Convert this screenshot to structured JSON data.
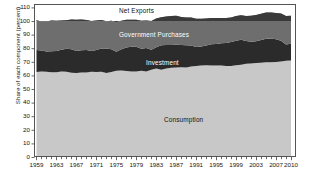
{
  "chart_data": {
    "type": "area",
    "stacked": true,
    "title": "",
    "xlabel": "",
    "ylabel": "Share of each component (percent)",
    "ylim": [
      0,
      112.5
    ],
    "yticks": [
      0,
      10,
      20,
      30,
      40,
      50,
      60,
      70,
      80,
      90,
      100,
      110
    ],
    "xlim": [
      1958.5,
      2011
    ],
    "xticks": [
      1959,
      1963,
      1967,
      1971,
      1975,
      1979,
      1983,
      1987,
      1991,
      1995,
      1999,
      2003,
      2007,
      2010
    ],
    "xtick_labels": [
      "1959",
      "1963",
      "1967",
      "1971",
      "1975",
      "1979",
      "1983",
      "1987",
      "1991",
      "1995",
      "1999",
      "2003",
      "2007",
      "2010"
    ],
    "minor_xtick_step": 1,
    "grid": false,
    "legend": "inline-annotations",
    "x": [
      1959,
      1960,
      1961,
      1962,
      1963,
      1964,
      1965,
      1966,
      1967,
      1968,
      1969,
      1970,
      1971,
      1972,
      1973,
      1974,
      1975,
      1976,
      1977,
      1978,
      1979,
      1980,
      1981,
      1982,
      1983,
      1984,
      1985,
      1986,
      1987,
      1988,
      1989,
      1990,
      1991,
      1992,
      1993,
      1994,
      1995,
      1996,
      1997,
      1998,
      1999,
      2000,
      2001,
      2002,
      2003,
      2004,
      2005,
      2006,
      2007,
      2008,
      2009,
      2010
    ],
    "series": [
      {
        "name": "Consumption",
        "color": "#c8c8c8",
        "label_color": "#111111",
        "label_x": 164,
        "label_y": 117,
        "values": [
          62.5,
          62.9,
          62.6,
          62.3,
          62.3,
          62.9,
          62.6,
          61.9,
          61.8,
          62.2,
          62.1,
          62.6,
          62.5,
          62.7,
          61.8,
          62.5,
          63.4,
          63.6,
          63.3,
          62.9,
          62.9,
          63.4,
          62.9,
          64.1,
          65.1,
          64.2,
          65.0,
          65.6,
          65.9,
          66.0,
          65.9,
          66.5,
          67.0,
          67.2,
          67.4,
          67.3,
          67.3,
          67.3,
          66.9,
          66.9,
          67.4,
          67.9,
          68.5,
          68.8,
          69.1,
          69.3,
          69.7,
          69.7,
          69.8,
          70.3,
          70.8,
          70.9
        ]
      },
      {
        "name": "Investment",
        "color": "#2b2b2b",
        "label_color": "#ffffff",
        "label_x": 146,
        "label_y": 60,
        "values": [
          16.2,
          15.5,
          14.9,
          15.5,
          15.7,
          16.0,
          17.0,
          17.3,
          16.2,
          16.3,
          16.6,
          15.4,
          16.2,
          17.0,
          17.9,
          16.8,
          14.0,
          15.6,
          17.3,
          18.2,
          18.2,
          16.2,
          17.2,
          14.7,
          15.6,
          18.0,
          17.3,
          16.8,
          16.6,
          16.3,
          16.3,
          15.5,
          13.8,
          14.0,
          14.6,
          15.6,
          15.8,
          16.3,
          17.0,
          17.6,
          18.0,
          18.4,
          16.8,
          16.0,
          16.1,
          16.8,
          17.3,
          17.5,
          16.8,
          15.1,
          11.9,
          12.4
        ]
      },
      {
        "name": "Government Purchases",
        "color": "#6e6e6e",
        "label_color": "#ffffff",
        "label_x": 119,
        "label_y": 32,
        "values": [
          21.8,
          21.2,
          22.1,
          22.5,
          22.1,
          21.4,
          20.9,
          21.9,
          23.0,
          22.6,
          22.0,
          22.0,
          21.6,
          21.0,
          20.1,
          20.9,
          21.6,
          20.9,
          20.3,
          19.9,
          19.8,
          20.5,
          20.2,
          21.2,
          21.1,
          20.6,
          21.0,
          21.3,
          21.3,
          20.7,
          20.4,
          20.6,
          20.8,
          20.4,
          19.8,
          19.3,
          19.1,
          18.6,
          18.3,
          18.1,
          18.2,
          17.9,
          18.4,
          19.0,
          19.3,
          19.2,
          19.2,
          19.1,
          19.3,
          20.2,
          21.0,
          20.6
        ]
      },
      {
        "name": "Net Exports",
        "color": "#3a3a3a",
        "label_color": "#111111",
        "label_x": 119,
        "label_y": 8,
        "values": [
          -0.5,
          0.4,
          0.4,
          -0.3,
          -0.1,
          -0.3,
          -0.5,
          -1.1,
          -1.0,
          -1.1,
          -0.7,
          0.0,
          -0.3,
          -0.7,
          0.2,
          -0.2,
          1.0,
          -0.1,
          -0.9,
          -1.0,
          -0.9,
          -0.1,
          -0.3,
          0.0,
          -1.8,
          -2.8,
          -3.3,
          -3.7,
          -3.8,
          -3.0,
          -2.6,
          -2.6,
          -1.6,
          -1.6,
          -1.8,
          -2.2,
          -2.2,
          -2.2,
          -2.2,
          -2.6,
          -3.6,
          -4.2,
          -3.7,
          -3.8,
          -4.5,
          -5.3,
          -6.2,
          -6.3,
          -5.9,
          -5.6,
          -3.7,
          -3.9
        ]
      }
    ],
    "annotations": [
      {
        "text": "Net Exports",
        "x": 119,
        "y": 8
      },
      {
        "text": "Government Purchases",
        "x": 119,
        "y": 32
      },
      {
        "text": "Investment",
        "x": 146,
        "y": 60
      },
      {
        "text": "Consumption",
        "x": 141,
        "y": 117
      }
    ],
    "colors": {
      "consumption": "#c8c8c8",
      "investment": "#2b2b2b",
      "government": "#6e6e6e",
      "net_exports": "#3a3a3a",
      "axis": "#4a4a4a",
      "background": "#ffffff"
    }
  }
}
